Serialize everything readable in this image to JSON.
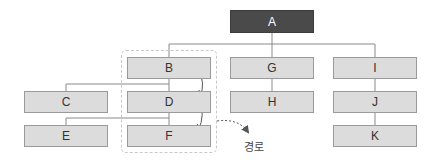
{
  "diagram": {
    "type": "tree",
    "colors": {
      "root_fill": "#4a4a4a",
      "node_fill": "#dcdcdc",
      "node_border": "#9a9a9a",
      "line": "#8a8a8a",
      "arrow": "#555555",
      "group_border": "#c8c8c8"
    },
    "nodes": {
      "A": {
        "label": "A",
        "children": [
          "B",
          "G",
          "I"
        ]
      },
      "B": {
        "label": "B",
        "children": [
          "C",
          "D"
        ]
      },
      "C": {
        "label": "C",
        "children": []
      },
      "D": {
        "label": "D",
        "children": [
          "E",
          "F"
        ]
      },
      "E": {
        "label": "E",
        "children": []
      },
      "F": {
        "label": "F",
        "children": []
      },
      "G": {
        "label": "G",
        "children": [
          "H"
        ]
      },
      "H": {
        "label": "H",
        "children": []
      },
      "I": {
        "label": "I",
        "children": [
          "J"
        ]
      },
      "J": {
        "label": "J",
        "children": [
          "K"
        ]
      },
      "K": {
        "label": "K",
        "children": []
      }
    },
    "highlighted_path": [
      "B",
      "D",
      "F"
    ],
    "path_label": "경로"
  }
}
